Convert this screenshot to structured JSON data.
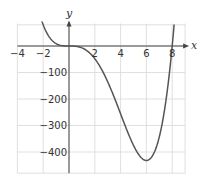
{
  "chart_data": {
    "type": "line",
    "title": "",
    "xlabel": "x",
    "ylabel": "y",
    "xlim": [
      -4,
      9
    ],
    "ylim": [
      -480,
      85
    ],
    "grid": true,
    "legend": null,
    "x_ticks": [
      -4,
      -2,
      2,
      4,
      6,
      8
    ],
    "x_tick_labels": [
      "−4",
      "−2",
      "2",
      "4",
      "6",
      "8"
    ],
    "y_ticks": [
      -100,
      -200,
      -300,
      -400
    ],
    "y_tick_labels": [
      "−100",
      "−200",
      "−300",
      "−400"
    ],
    "grid_x": [
      -4,
      -2,
      0,
      2,
      4,
      6,
      8,
      9
    ],
    "grid_y": [
      80,
      0,
      -100,
      -200,
      -300,
      -400,
      -480
    ],
    "series": [
      {
        "name": "f(x) = x^4 - 8x^3",
        "formula": "x^4 - 8*x^3",
        "x": [
          -2.0,
          -1.5,
          -1.0,
          -0.5,
          0.0,
          0.5,
          1.0,
          1.5,
          2.0,
          2.5,
          3.0,
          3.5,
          4.0,
          4.5,
          5.0,
          5.5,
          6.0,
          6.5,
          7.0,
          7.5,
          8.0
        ],
        "y": [
          80,
          32.06,
          9,
          1.06,
          0,
          -0.94,
          -7,
          -21.94,
          -48,
          -85.94,
          -135,
          -193.94,
          -256,
          -314.94,
          -375,
          -417.94,
          -432,
          -411.94,
          -343,
          -210.94,
          0
        ]
      }
    ],
    "annotations": []
  },
  "labels": {
    "x_axis": "x",
    "y_axis": "y"
  }
}
